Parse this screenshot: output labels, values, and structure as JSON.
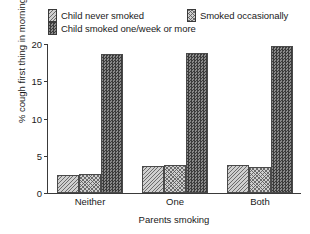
{
  "chart_data": {
    "type": "bar",
    "title": "",
    "xlabel": "Parents smoking",
    "ylabel": "% cough first thing in morning",
    "categories": [
      "Neither",
      "One",
      "Both"
    ],
    "ylim": [
      0,
      20
    ],
    "yticks": [
      0,
      5,
      10,
      15,
      20
    ],
    "ytick_labels": [
      "0",
      "5",
      "10",
      "15",
      "20"
    ],
    "grid": false,
    "legend_position": "above-plot",
    "series": [
      {
        "name": "Child never smoked",
        "swatch": "light-diagonal-hatch",
        "values": [
          2.4,
          3.6,
          3.75
        ]
      },
      {
        "name": "Smoked occasionally",
        "swatch": "light-crosshatch",
        "values": [
          2.6,
          3.7,
          3.5
        ]
      },
      {
        "name": "Child smoked one/week or more",
        "swatch": "dark-checker",
        "values": [
          18.7,
          18.8,
          19.7
        ]
      }
    ]
  },
  "colors": {
    "axis": "#3a3a3a",
    "light_fill": "#cfcfcf",
    "dark_fill": "#5e5e5e",
    "background": "#ffffff",
    "text": "#1a1a1a"
  }
}
